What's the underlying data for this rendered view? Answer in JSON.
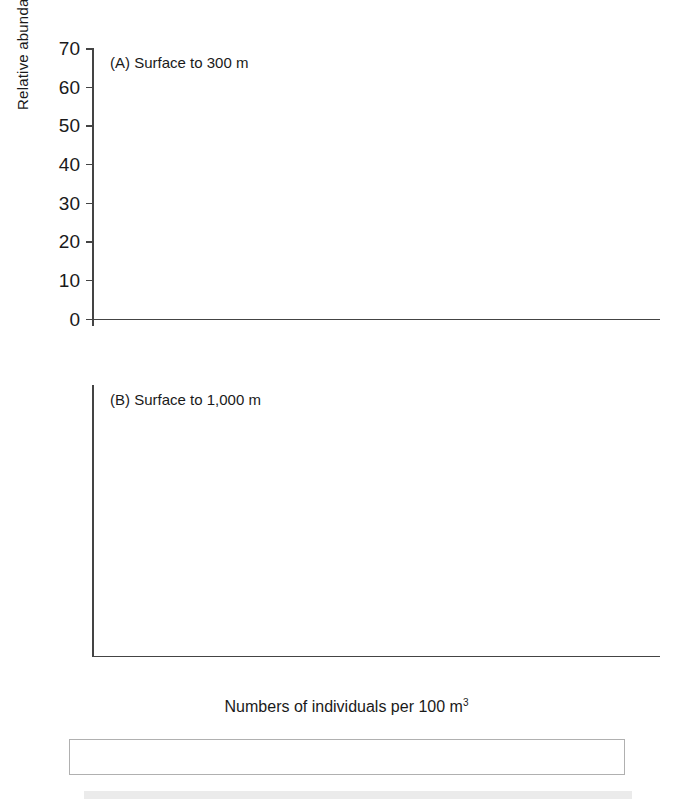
{
  "axes": {
    "ylabel": "Relative abundances(%)",
    "xlabel_pre": "Numbers of individuals per 100 m",
    "xlabel_sup": "3",
    "yticks": [
      "0",
      "10",
      "20",
      "30",
      "40",
      "50",
      "60",
      "70"
    ],
    "xticks": [
      "Trans",
      "MS",
      "GA/RS",
      "Ant",
      "Mag"
    ]
  },
  "panels": {
    "a": {
      "title": "(A) Surface to 300 m"
    },
    "b": {
      "title": "(B) Surface to 1,000 m"
    }
  },
  "legend": {
    "items": [
      {
        "label": "<1",
        "swatch": "white-square-icon",
        "color": "#ffffff"
      },
      {
        "label": "1–10",
        "swatch": "forward-hatch-square-icon",
        "color": "#ffffff"
      },
      {
        "label": "11–100",
        "swatch": "cross-hatch-square-icon",
        "color": "#fdfdfd"
      },
      {
        "label": "101–1,000",
        "swatch": "light-gray-square-icon",
        "color": "#b9b9b9"
      },
      {
        "label": "1,001–10,000",
        "swatch": "dark-gray-square-icon",
        "color": "#585858"
      },
      {
        "label": ">10,000",
        "swatch": "black-square-icon",
        "color": "#0a0a0a"
      }
    ]
  },
  "chart_data": {
    "type": "bar",
    "xlabel": "Numbers of individuals per 100 m3",
    "ylabel": "Relative abundances(%)",
    "ylim": [
      0,
      70
    ],
    "ytick_step": 10,
    "grid": false,
    "legend_position": "bottom",
    "categories": [
      "Trans",
      "MS",
      "GA/RS",
      "Ant",
      "Mag"
    ],
    "series_names": [
      "<1",
      "1–10",
      "11–100",
      "101–1,000",
      "1,001–10,000",
      ">10,000"
    ],
    "panels": [
      {
        "key": "a",
        "title": "(A) Surface to 300 m",
        "annotations": [
          {
            "category": "Trans",
            "value": "142"
          },
          {
            "category": "MS",
            "value": "102"
          },
          {
            "category": "GA/RS",
            "value": "45"
          },
          {
            "category": "Ant",
            "value": "52"
          },
          {
            "category": "Mag",
            "value": "30"
          }
        ],
        "series": [
          {
            "name": "<1",
            "values": [
              30.8,
              46.5,
              11.5,
              56.5,
              10.7
            ]
          },
          {
            "name": "1–10",
            "values": [
              37.2,
              22.7,
              38.0,
              29.2,
              43.8
            ]
          },
          {
            "name": "11–100",
            "values": [
              22.2,
              20.0,
              27.1,
              10.3,
              14.2
            ]
          },
          {
            "name": "101–1,000",
            "values": [
              9.4,
              10.0,
              18.0,
              6.3,
              20.8
            ]
          },
          {
            "name": "1,001–10,000",
            "values": [
              1.0,
              2.1,
              7.2,
              0,
              10.9
            ]
          },
          {
            "name": ">10,000",
            "values": [
              0,
              0,
              0,
              0,
              6.0
            ]
          }
        ]
      },
      {
        "key": "b",
        "title": "(B) Surface to 1,000 m",
        "annotations": [
          {
            "category": "MS",
            "value": "118"
          },
          {
            "category": "GA/RS",
            "value": "46"
          },
          {
            "category": "Ant",
            "value": "84"
          }
        ],
        "series": [
          {
            "name": "<1",
            "values": [
              0,
              45.4,
              11.3,
              62.5,
              0
            ]
          },
          {
            "name": "1–10",
            "values": [
              0,
              38.6,
              40.0,
              28.0,
              0
            ]
          },
          {
            "name": "11–100",
            "values": [
              0,
              13.8,
              35.0,
              8.9,
              0
            ]
          },
          {
            "name": "101–1,000",
            "values": [
              0,
              4.0,
              15.5,
              3.0,
              0
            ]
          },
          {
            "name": "1,001–10,000",
            "values": [
              0,
              0,
              0,
              0,
              0
            ]
          },
          {
            "name": ">10,000",
            "values": [
              0,
              0,
              0,
              0,
              0
            ]
          }
        ]
      }
    ]
  }
}
